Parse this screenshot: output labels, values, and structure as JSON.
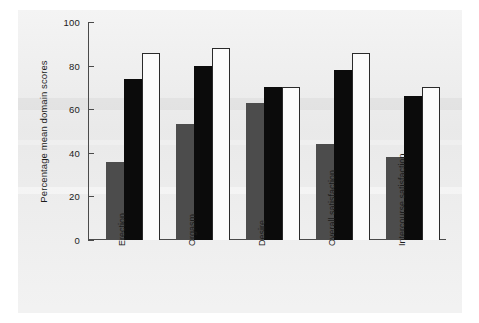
{
  "chart_data": {
    "type": "bar",
    "title": "",
    "xlabel": "",
    "ylabel": "Percentage mean domain scores",
    "ylim": [
      0,
      100
    ],
    "yticks": [
      0,
      20,
      40,
      60,
      80,
      100
    ],
    "grid": false,
    "legend": "none",
    "categories": [
      "Erection",
      "Orgasm",
      "Desire",
      "Overall satisfaction",
      "Intercourse satisfaction"
    ],
    "series": [
      {
        "name": "series-1",
        "color": "#4c4c4c",
        "values": [
          36,
          53,
          63,
          44,
          38
        ]
      },
      {
        "name": "series-2",
        "color": "#0b0b0b",
        "values": [
          74,
          80,
          70,
          78,
          66
        ]
      },
      {
        "name": "series-3",
        "color": "#fbfbfb",
        "values": [
          86,
          88,
          70,
          86,
          70
        ]
      }
    ]
  },
  "axis": {
    "ylabel": "Percentage mean domain scores",
    "ticks": [
      "100",
      "80",
      "60",
      "40",
      "20",
      "0"
    ]
  }
}
